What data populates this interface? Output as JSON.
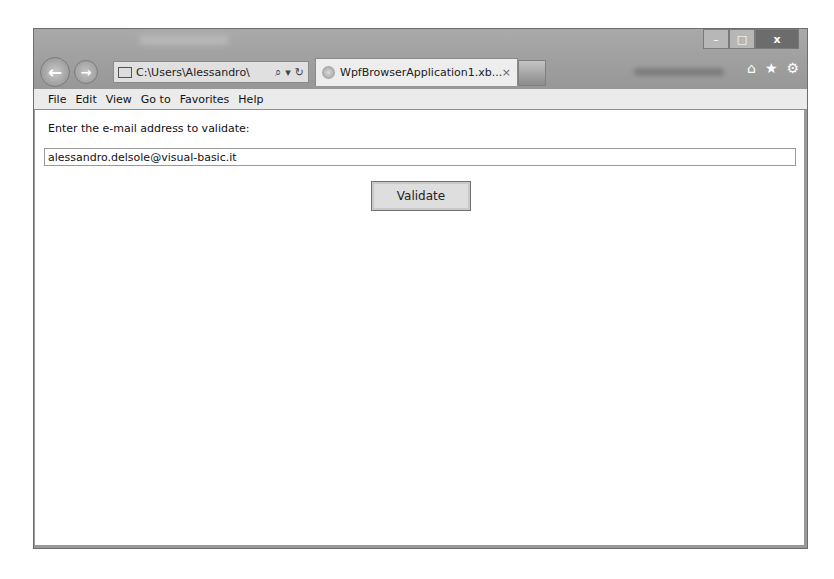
{
  "window": {
    "controls": {
      "minimize": "–",
      "maximize": "□",
      "close": "x"
    }
  },
  "toolbar": {
    "back_icon": "←",
    "forward_icon": "→",
    "address": "C:\\Users\\Alessandro\\",
    "search_icon": "⌕",
    "dropdown_icon": "▾",
    "refresh_icon": "↻"
  },
  "tab": {
    "title": "WpfBrowserApplication1.xb...",
    "close_icon": "×"
  },
  "right_icons": {
    "home": "⌂",
    "favorites": "★",
    "settings": "⚙"
  },
  "menu": {
    "items": [
      "File",
      "Edit",
      "View",
      "Go to",
      "Favorites",
      "Help"
    ]
  },
  "page": {
    "prompt": "Enter the e-mail address to validate:",
    "email_value": "alessandro.delsole@visual-basic.it",
    "validate_label": "Validate"
  }
}
